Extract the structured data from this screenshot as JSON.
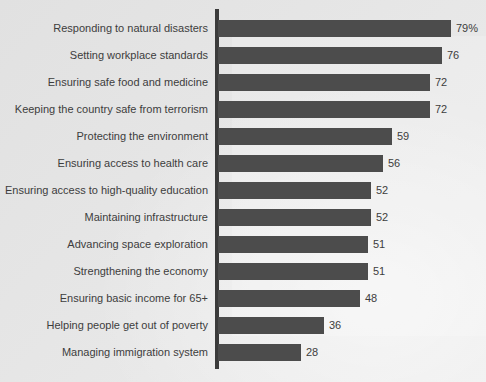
{
  "chart_data": {
    "type": "bar",
    "orientation": "horizontal",
    "title": "",
    "subtitle": "",
    "xlabel": "",
    "ylabel": "",
    "xlim": [
      0,
      79
    ],
    "grid": false,
    "legend": false,
    "legend_position": "none",
    "axis_tick_labels": [],
    "bar_color": "#4c4c4c",
    "background_color": "#e4e4e4",
    "text_color": "#3d3d3d",
    "categories": [
      "Responding to natural disasters",
      "Setting workplace standards",
      "Ensuring safe food and medicine",
      "Keeping the country safe from terrorism",
      "Protecting the environment",
      "Ensuring access to health care",
      "Ensuring access to high-quality education",
      "Maintaining infrastructure",
      "Advancing space exploration",
      "Strengthening the economy",
      "Ensuring basic income for 65+",
      "Helping people get out of poverty",
      "Managing immigration system"
    ],
    "values": [
      79,
      76,
      72,
      72,
      59,
      56,
      52,
      52,
      51,
      51,
      48,
      36,
      28
    ],
    "value_labels": [
      "79%",
      "76",
      "72",
      "72",
      "59",
      "56",
      "52",
      "52",
      "51",
      "51",
      "48",
      "36",
      "28"
    ]
  }
}
